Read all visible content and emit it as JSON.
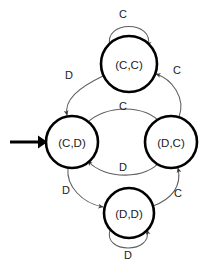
{
  "diagram": {
    "type": "finite-state-machine",
    "title": "",
    "background_color": "#ffffff",
    "node_stroke_color": "#000000",
    "node_fill_color": "#ffffff",
    "edge_color": "#5f5f5f",
    "label_color": "#1a1a1a",
    "start_marker_color": "#000000",
    "states": [
      {
        "id": "cc",
        "label": "(C,C)",
        "cx": 129,
        "cy": 64,
        "r": 28,
        "is_start": false
      },
      {
        "id": "cd",
        "label": "(C,D)",
        "cx": 72,
        "cy": 142,
        "r": 26,
        "is_start": true
      },
      {
        "id": "dc",
        "label": "(D,C)",
        "cx": 171,
        "cy": 142,
        "r": 26,
        "is_start": false
      },
      {
        "id": "dd",
        "label": "(D,D)",
        "cx": 129,
        "cy": 213,
        "r": 25,
        "is_start": false
      }
    ],
    "transitions": [
      {
        "id": "cc-self",
        "from": "cc",
        "to": "cc",
        "label": "C",
        "label_x": 123,
        "label_y": 14,
        "kind": "self-loop-top"
      },
      {
        "id": "cc-to-cd",
        "from": "cc",
        "to": "cd",
        "label": "D",
        "label_x": 69,
        "label_y": 75,
        "kind": "arc"
      },
      {
        "id": "dc-to-cc",
        "from": "dc",
        "to": "cc",
        "label": "C",
        "label_x": 177,
        "label_y": 70,
        "kind": "arc"
      },
      {
        "id": "cd-to-dc",
        "from": "cd",
        "to": "dc",
        "label": "C",
        "label_x": 123,
        "label_y": 106,
        "kind": "arc"
      },
      {
        "id": "dc-to-cd",
        "from": "dc",
        "to": "cd",
        "label": "D",
        "label_x": 123,
        "label_y": 167,
        "kind": "arc"
      },
      {
        "id": "cd-to-dd",
        "from": "cd",
        "to": "dd",
        "label": "D",
        "label_x": 66,
        "label_y": 190,
        "kind": "arc"
      },
      {
        "id": "dd-to-dc",
        "from": "dd",
        "to": "dc",
        "label": "C",
        "label_x": 178,
        "label_y": 193,
        "kind": "arc"
      },
      {
        "id": "dd-self",
        "from": "dd",
        "to": "dd",
        "label": "D",
        "label_x": 128,
        "label_y": 255,
        "kind": "self-loop-bottom"
      }
    ],
    "start_marker": {
      "label": "",
      "x1": 10,
      "y1": 142,
      "x2": 46,
      "y2": 142
    }
  }
}
